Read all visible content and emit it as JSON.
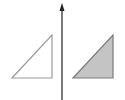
{
  "diagram": {
    "type": "reflection",
    "axis": {
      "x": 62,
      "y_top": 5,
      "y_bottom": 100,
      "color": "#222222",
      "arrow": "up"
    },
    "shapes": [
      {
        "name": "original-triangle",
        "points": "12,78 52,78 52,35",
        "fill": "#ffffff",
        "stroke": "#9a9a9a"
      },
      {
        "name": "reflected-triangle",
        "points": "73,78 113,78 113,35",
        "fill": "#c4c4c4",
        "stroke": "#7a7a7a"
      }
    ]
  },
  "colors": {
    "axis": "#222222",
    "shaded_fill": "#c4c4c4",
    "outline": "#9a9a9a"
  }
}
